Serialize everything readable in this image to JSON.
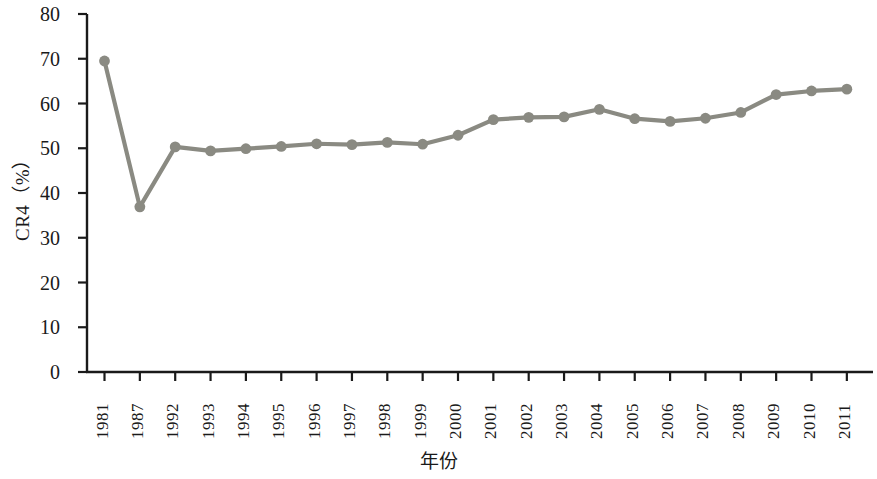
{
  "chart_data": {
    "type": "line",
    "title": "",
    "xlabel": "年份",
    "ylabel": "CR4（%）",
    "ylim": [
      0,
      80
    ],
    "yticks": [
      0,
      10,
      20,
      30,
      40,
      50,
      60,
      70,
      80
    ],
    "grid": false,
    "legend": null,
    "marker": "circle",
    "line_color": "#8a8a82",
    "marker_color": "#8a8a82",
    "axis_color": "#1a1a1a",
    "categories": [
      "1981",
      "1987",
      "1992",
      "1993",
      "1994",
      "1995",
      "1996",
      "1997",
      "1998",
      "1999",
      "2000",
      "2001",
      "2002",
      "2003",
      "2004",
      "2005",
      "2006",
      "2007",
      "2008",
      "2009",
      "2010",
      "2011"
    ],
    "values": [
      69.5,
      36.9,
      50.3,
      49.4,
      49.9,
      50.4,
      51.0,
      50.8,
      51.3,
      50.9,
      52.9,
      56.4,
      56.9,
      57.0,
      58.7,
      56.6,
      56.0,
      56.7,
      58.0,
      62.0,
      62.8,
      63.2
    ],
    "series": [
      {
        "name": "CR4",
        "values": [
          69.5,
          36.9,
          50.3,
          49.4,
          49.9,
          50.4,
          51.0,
          50.8,
          51.3,
          50.9,
          52.9,
          56.4,
          56.9,
          57.0,
          58.7,
          56.6,
          56.0,
          56.7,
          58.0,
          62.0,
          62.8,
          63.2
        ]
      }
    ]
  }
}
